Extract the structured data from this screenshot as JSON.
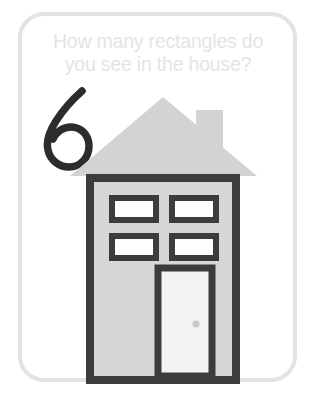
{
  "card": {
    "border_color": "#e3e3e3",
    "background_color": "#ffffff"
  },
  "question": {
    "text": "How many rectangles do\nyou see in the house?",
    "line_1": "How many rectangles do",
    "line_2": "you see in the house?",
    "color": "#e4e4e4"
  },
  "answer": {
    "value": "6",
    "color": "#2c2c2c",
    "style": "handwritten"
  },
  "illustration": {
    "subject": "house",
    "roof": {
      "name": "roof-triangle",
      "color": "#d3d3d3"
    },
    "chimney": {
      "name": "chimney",
      "color": "#d3d3d3"
    },
    "wall": {
      "name": "house-wall",
      "fill_color": "#d6d6d6",
      "outline_color": "#3c3c3c"
    },
    "windows": [
      {
        "name": "window-top-left"
      },
      {
        "name": "window-top-right"
      },
      {
        "name": "window-bottom-left"
      },
      {
        "name": "window-bottom-right"
      }
    ],
    "window_style": {
      "border_color": "#3c3c3c",
      "fill_color": "#fdfdfd"
    },
    "door": {
      "name": "door",
      "frame_color": "#3c3c3c",
      "panel_color": "#f3f3f3"
    },
    "doorknob": {
      "name": "doorknob",
      "color": "#c9c9c9"
    },
    "rectangle_count": 6
  }
}
